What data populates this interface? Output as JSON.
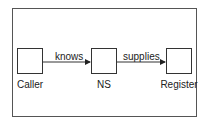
{
  "diagram": {
    "nodes": [
      {
        "id": "caller",
        "label": "Caller"
      },
      {
        "id": "ns",
        "label": "NS"
      },
      {
        "id": "register",
        "label": "Register"
      }
    ],
    "edges": [
      {
        "from": "caller",
        "to": "ns",
        "label": "knows"
      },
      {
        "from": "ns",
        "to": "register",
        "label": "supplies"
      }
    ]
  }
}
